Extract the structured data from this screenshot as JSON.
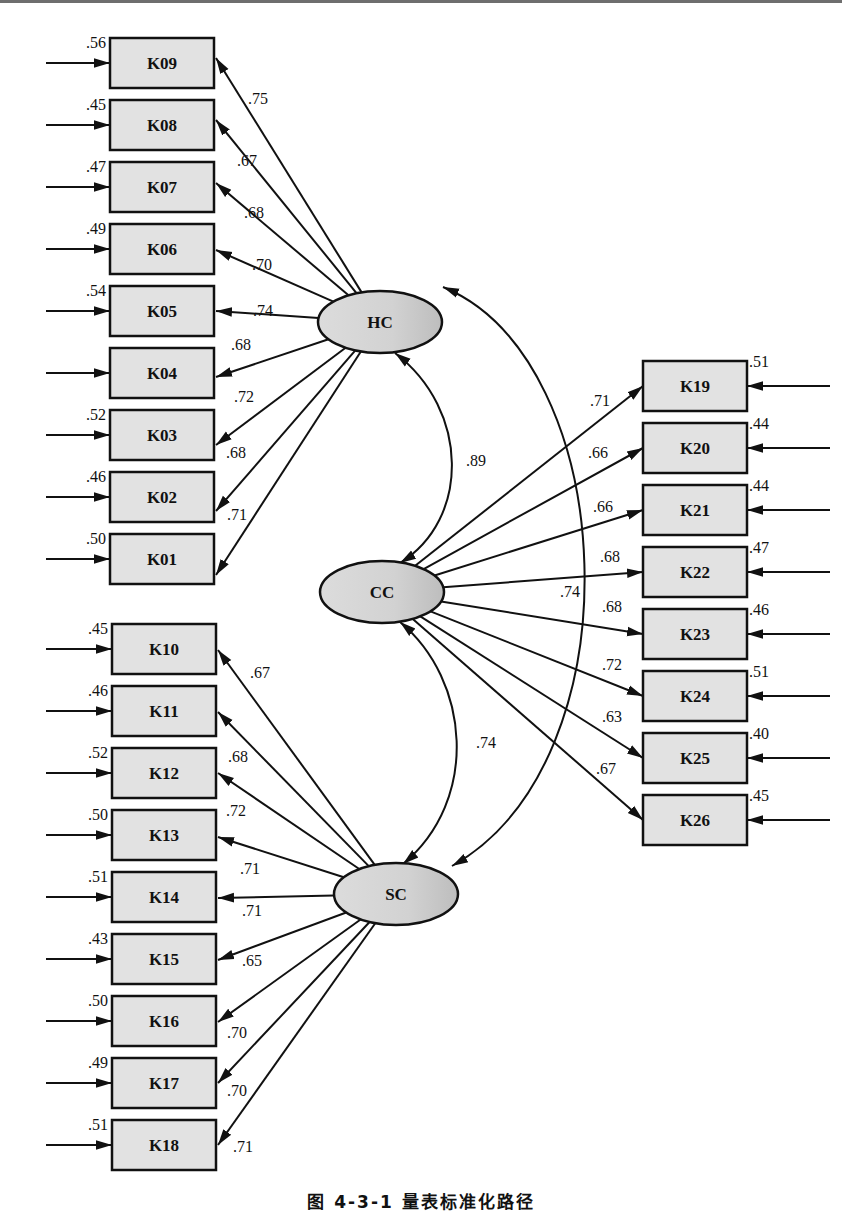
{
  "figure": {
    "caption": "图 4-3-1  量表标准化路径",
    "latent_factors": [
      {
        "id": "HC",
        "label": "HC",
        "cx": 380,
        "cy": 322
      },
      {
        "id": "CC",
        "label": "CC",
        "cx": 382,
        "cy": 592
      },
      {
        "id": "SC",
        "label": "SC",
        "cx": 396,
        "cy": 894
      }
    ],
    "indicators_left_hc": [
      {
        "label": "K09",
        "loading": ".75",
        "error": ".56"
      },
      {
        "label": "K08",
        "loading": ".67",
        "error": ".45"
      },
      {
        "label": "K07",
        "loading": ".68",
        "error": ".47"
      },
      {
        "label": "K06",
        "loading": ".70",
        "error": ".49"
      },
      {
        "label": "K05",
        "loading": ".74",
        "error": ".54"
      },
      {
        "label": "K04",
        "loading": ".68",
        "error": ""
      },
      {
        "label": "K03",
        "loading": ".72",
        "error": ".52"
      },
      {
        "label": "K02",
        "loading": ".68",
        "error": ".46"
      },
      {
        "label": "K01",
        "loading": ".71",
        "error": ".50"
      }
    ],
    "indicators_left_sc": [
      {
        "label": "K10",
        "loading": ".67",
        "error": ".45"
      },
      {
        "label": "K11",
        "loading": ".68",
        "error": ".46"
      },
      {
        "label": "K12",
        "loading": ".72",
        "error": ".52"
      },
      {
        "label": "K13",
        "loading": ".71",
        "error": ".50"
      },
      {
        "label": "K14",
        "loading": ".71",
        "error": ".51"
      },
      {
        "label": "K15",
        "loading": ".65",
        "error": ".43"
      },
      {
        "label": "K16",
        "loading": ".70",
        "error": ".50"
      },
      {
        "label": "K17",
        "loading": ".70",
        "error": ".49"
      },
      {
        "label": "K18",
        "loading": ".71",
        "error": ".51"
      }
    ],
    "indicators_right_cc": [
      {
        "label": "K19",
        "loading": ".71",
        "error": ".51"
      },
      {
        "label": "K20",
        "loading": ".66",
        "error": ".44"
      },
      {
        "label": "K21",
        "loading": ".66",
        "error": ".44"
      },
      {
        "label": "K22",
        "loading": ".68",
        "error": ".47"
      },
      {
        "label": "K23",
        "loading": ".68",
        "error": ".46"
      },
      {
        "label": "K24",
        "loading": ".72",
        "error": ".51"
      },
      {
        "label": "K25",
        "loading": ".63",
        "error": ".40"
      },
      {
        "label": "K26",
        "loading": ".67",
        "error": ".45"
      }
    ],
    "correlations": [
      {
        "from": "HC",
        "to": "CC",
        "value": ".89"
      },
      {
        "from": "CC",
        "to": "SC",
        "value": ".74"
      },
      {
        "from": "HC",
        "to": "SC",
        "value": ".74"
      }
    ],
    "colors": {
      "box_fill": "#e2e2e2",
      "ellipse_fill": "#d4d4d4",
      "stroke": "#111111"
    }
  }
}
